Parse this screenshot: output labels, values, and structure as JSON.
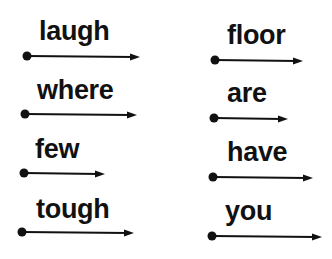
{
  "words": [
    {
      "text": "laugh",
      "x": 39,
      "y": 18
    },
    {
      "text": "where",
      "x": 37,
      "y": 77
    },
    {
      "text": "few",
      "x": 35,
      "y": 136
    },
    {
      "text": "tough",
      "x": 36,
      "y": 196
    },
    {
      "text": "floor",
      "x": 227,
      "y": 22
    },
    {
      "text": "are",
      "x": 227,
      "y": 80
    },
    {
      "text": "have",
      "x": 227,
      "y": 139
    },
    {
      "text": "you",
      "x": 225,
      "y": 198
    }
  ],
  "arrows": [
    {
      "x1": 27,
      "y1": 56,
      "x2": 140
    },
    {
      "x1": 25,
      "y1": 114,
      "x2": 137
    },
    {
      "x1": 24,
      "y1": 173,
      "x2": 105
    },
    {
      "x1": 22,
      "y1": 232,
      "x2": 134
    },
    {
      "x1": 215,
      "y1": 60,
      "x2": 303
    },
    {
      "x1": 214,
      "y1": 118,
      "x2": 288
    },
    {
      "x1": 213,
      "y1": 177,
      "x2": 313
    },
    {
      "x1": 212,
      "y1": 236,
      "x2": 322
    }
  ],
  "colors": {
    "ink": "#111111",
    "background": "#ffffff"
  }
}
